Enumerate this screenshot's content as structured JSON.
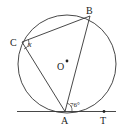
{
  "labels": {
    "A": "A",
    "B": "B",
    "C": "C",
    "O": "O",
    "T": "T",
    "angle_x": "x",
    "angle_76": "76°"
  },
  "colors": {
    "stroke": "#222222",
    "background": "#ffffff"
  }
}
